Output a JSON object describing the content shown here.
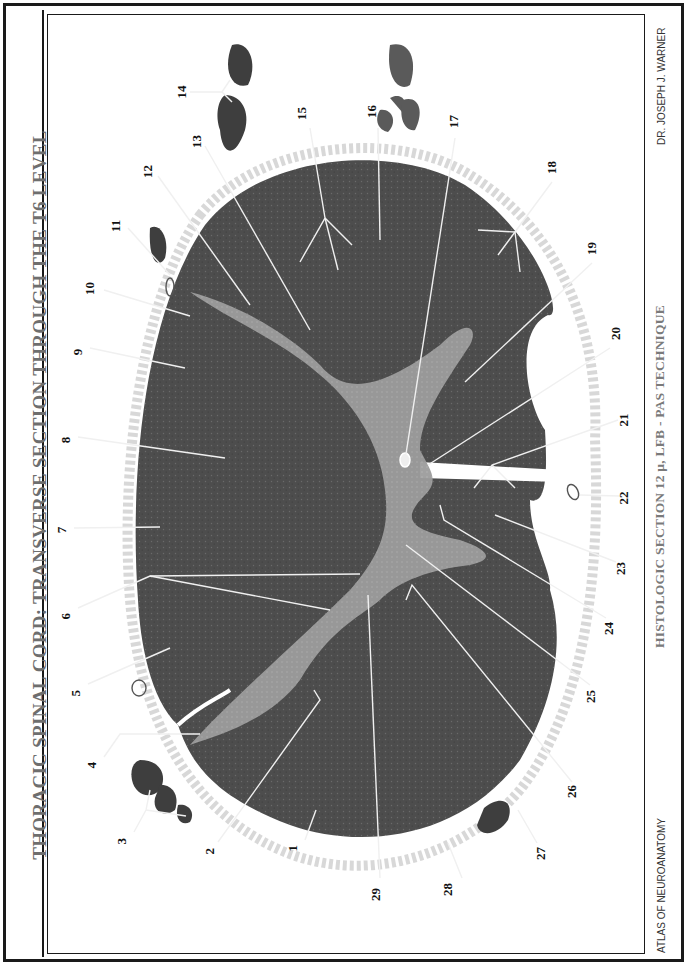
{
  "title": "THORACIC SPINAL CORD:  TRANSVERSE SECTION THROUGH THE T6 LEVEL",
  "subtitle": "HISTOLOGIC SECTION 12 µ, LFB - PAS TECHNIQUE",
  "credit": "DR. JOSEPH J. WARNER",
  "series": "ATLAS OF NEUROANATOMY",
  "colors": {
    "white_matter": "#4a4a4a",
    "gray_matter": "#9a9a9a",
    "meninges": "#d4d4d4",
    "label_line": "#e8e8e8",
    "text_gray": "#6e6e6e"
  },
  "labels": [
    {
      "n": "1",
      "x": 297,
      "y": 845
    },
    {
      "n": "2",
      "x": 214,
      "y": 848
    },
    {
      "n": "3",
      "x": 126,
      "y": 838
    },
    {
      "n": "4",
      "x": 96,
      "y": 762
    },
    {
      "n": "5",
      "x": 80,
      "y": 690
    },
    {
      "n": "6",
      "x": 70,
      "y": 613
    },
    {
      "n": "7",
      "x": 66,
      "y": 530
    },
    {
      "n": "8",
      "x": 70,
      "y": 440
    },
    {
      "n": "9",
      "x": 82,
      "y": 352
    },
    {
      "n": "10",
      "x": 94,
      "y": 295
    },
    {
      "n": "11",
      "x": 120,
      "y": 232
    },
    {
      "n": "12",
      "x": 152,
      "y": 178
    },
    {
      "n": "13",
      "x": 201,
      "y": 148
    },
    {
      "n": "14",
      "x": 182,
      "y": 96
    },
    {
      "n": "15",
      "x": 306,
      "y": 120
    },
    {
      "n": "16",
      "x": 376,
      "y": 118
    },
    {
      "n": "17",
      "x": 458,
      "y": 128
    },
    {
      "n": "18",
      "x": 556,
      "y": 174
    },
    {
      "n": "19",
      "x": 596,
      "y": 255
    },
    {
      "n": "20",
      "x": 620,
      "y": 340
    },
    {
      "n": "21",
      "x": 628,
      "y": 420
    },
    {
      "n": "22",
      "x": 628,
      "y": 498
    },
    {
      "n": "23",
      "x": 625,
      "y": 562
    },
    {
      "n": "24",
      "x": 613,
      "y": 622
    },
    {
      "n": "25",
      "x": 595,
      "y": 690
    },
    {
      "n": "26",
      "x": 576,
      "y": 785
    },
    {
      "n": "27",
      "x": 545,
      "y": 847
    },
    {
      "n": "28",
      "x": 452,
      "y": 883
    },
    {
      "n": "29",
      "x": 380,
      "y": 888
    }
  ]
}
